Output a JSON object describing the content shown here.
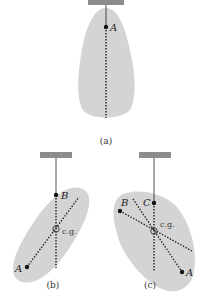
{
  "figure": {
    "panels": [
      {
        "caption": "(a)",
        "points": [
          {
            "label": "A"
          }
        ],
        "description": "Object suspended from point A; vertical dotted line drawn below A"
      },
      {
        "caption": "(b)",
        "points": [
          {
            "label": "B"
          },
          {
            "label": "A"
          }
        ],
        "cg_label": "c.g.",
        "description": "Object suspended from point B; dotted lines through B and A intersect at center of gravity"
      },
      {
        "caption": "(c)",
        "points": [
          {
            "label": "B"
          },
          {
            "label": "C"
          },
          {
            "label": "A"
          }
        ],
        "cg_label": "c.g.",
        "description": "Object suspended from point C; three dotted lines intersect at center of gravity"
      }
    ],
    "colors": {
      "object_fill": "#d4d4d4",
      "support_bar": "#8c8c8c",
      "line": "#222222"
    }
  }
}
